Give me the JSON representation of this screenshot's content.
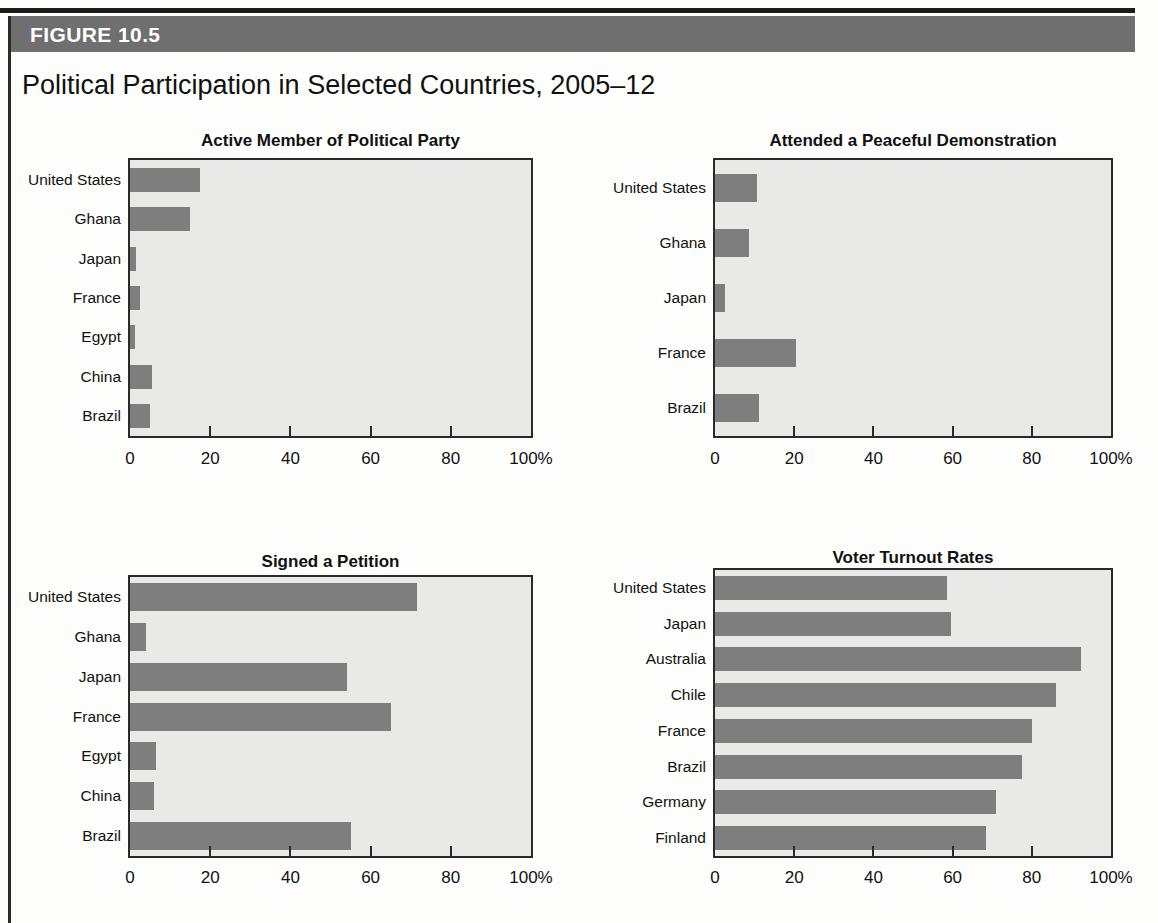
{
  "figure": {
    "banner_label": "FIGURE 10.5",
    "title": "Political Participation in Selected Countries, 2005–12"
  },
  "colors": {
    "banner": "#6f6f6f",
    "bar": "#7e7e7e",
    "plot_background": "#e9e9e7",
    "axis": "#2a2a2a",
    "text": "#111111"
  },
  "axis": {
    "tick_labels": [
      "0",
      "20",
      "40",
      "60",
      "80",
      "100%"
    ],
    "tick_values": [
      0,
      20,
      40,
      60,
      80,
      100
    ]
  },
  "chart_data": [
    {
      "type": "bar",
      "orientation": "horizontal",
      "title": "Active Member of Political Party",
      "xlabel": "",
      "ylabel": "",
      "xlim": [
        0,
        100
      ],
      "grid": false,
      "legend": "none",
      "categories": [
        "United States",
        "Ghana",
        "Japan",
        "France",
        "Egypt",
        "China",
        "Brazil"
      ],
      "values": [
        17.5,
        15,
        1.5,
        2.5,
        1.2,
        5.5,
        5
      ],
      "tick_labels": [
        "0",
        "20",
        "40",
        "60",
        "80",
        "100%"
      ]
    },
    {
      "type": "bar",
      "orientation": "horizontal",
      "title": "Attended a Peaceful Demonstration",
      "xlabel": "",
      "ylabel": "",
      "xlim": [
        0,
        100
      ],
      "grid": false,
      "legend": "none",
      "categories": [
        "United States",
        "Ghana",
        "Japan",
        "France",
        "Brazil"
      ],
      "values": [
        10.5,
        8.5,
        2.5,
        20.5,
        11
      ],
      "tick_labels": [
        "0",
        "20",
        "40",
        "60",
        "80",
        "100%"
      ]
    },
    {
      "type": "bar",
      "orientation": "horizontal",
      "title": "Signed a Petition",
      "xlabel": "",
      "ylabel": "",
      "xlim": [
        0,
        100
      ],
      "grid": false,
      "legend": "none",
      "categories": [
        "United States",
        "Ghana",
        "Japan",
        "France",
        "Egypt",
        "China",
        "Brazil"
      ],
      "values": [
        71.5,
        4,
        54,
        65,
        6.5,
        6,
        55
      ],
      "tick_labels": [
        "0",
        "20",
        "40",
        "60",
        "80",
        "100%"
      ]
    },
    {
      "type": "bar",
      "orientation": "horizontal",
      "title": "Voter Turnout Rates",
      "xlabel": "",
      "ylabel": "",
      "xlim": [
        0,
        100
      ],
      "grid": false,
      "legend": "none",
      "categories": [
        "United States",
        "Japan",
        "Australia",
        "Chile",
        "France",
        "Brazil",
        "Germany",
        "Finland"
      ],
      "values": [
        58.5,
        59.5,
        92.5,
        86,
        80,
        77.5,
        71,
        68.5
      ],
      "tick_labels": [
        "0",
        "20",
        "40",
        "60",
        "80",
        "100%"
      ]
    }
  ]
}
